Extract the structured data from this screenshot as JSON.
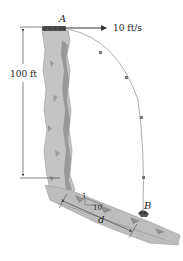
{
  "diagram": {
    "type": "projectile-motion",
    "labels": {
      "point_a": "A",
      "point_b": "B",
      "velocity": "10 ft/s",
      "height": "100 ft",
      "slope_rise": "1",
      "slope_run": "10",
      "distance": "d"
    },
    "colors": {
      "rock_light": "#c8c8c8",
      "rock_mid": "#a9a9a9",
      "rock_dark": "#7d7d7d",
      "trajectory": "#888888",
      "marker": "#777777",
      "line": "#333333"
    }
  }
}
